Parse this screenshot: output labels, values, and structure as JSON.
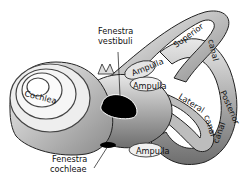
{
  "figure": {
    "labels": {
      "cochlea": "Cochlea",
      "fenestra_vestibuli_1": "Fenestra",
      "fenestra_vestibuli_2": "vestibuli",
      "ampulla_upper": "Ampulla",
      "ampulla_middle": "Ampulla",
      "ampulla_lower": "Ampulla",
      "superior": "Superior",
      "canal_superior": "canal",
      "lateral": "Lateral",
      "canal_lateral": "canal",
      "posterior": "Posterior",
      "canal_posterior": "canal",
      "fenestra_cochleae_1": "Fenestra",
      "fenestra_cochleae_2": "cochleae"
    }
  }
}
